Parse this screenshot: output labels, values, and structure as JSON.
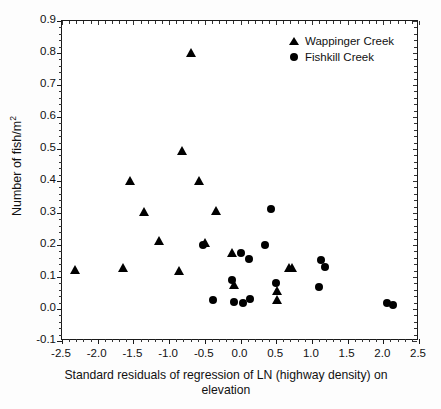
{
  "chart_data": {
    "type": "scatter",
    "title": "",
    "xlabel": "Standard residuals of regression of LN (highway density) on elevation",
    "ylabel": "Number of fish/m",
    "ylabel_sup": "2",
    "xlim": [
      -2.5,
      2.5
    ],
    "ylim": [
      -0.1,
      0.9
    ],
    "xticks": [
      "-2.5",
      "-2.0",
      "-1.5",
      "-1.0",
      "-0.5",
      "0.0",
      "0.5",
      "1.0",
      "1.5",
      "2.0",
      "2.5"
    ],
    "xtick_values": [
      -2.5,
      -2.0,
      -1.5,
      -1.0,
      -0.5,
      0.0,
      0.5,
      1.0,
      1.5,
      2.0,
      2.5
    ],
    "yticks": [
      "0.9",
      "0.8",
      "0.7",
      "0.6",
      "0.5",
      "0.4",
      "0.3",
      "0.2",
      "0.1",
      "0.0",
      "-0.1"
    ],
    "ytick_values": [
      0.9,
      0.8,
      0.7,
      0.6,
      0.5,
      0.4,
      0.3,
      0.2,
      0.1,
      0.0,
      -0.1
    ],
    "minor_ticks_per_interval": 5,
    "grid": false,
    "legend_position": "top-right",
    "series": [
      {
        "name": "Wappinger Creek",
        "marker": "triangle",
        "color": "#000000",
        "points": [
          [
            -2.31,
            0.12
          ],
          [
            -1.65,
            0.128
          ],
          [
            -1.54,
            0.4
          ],
          [
            -1.35,
            0.302
          ],
          [
            -1.14,
            0.212
          ],
          [
            -0.86,
            0.118
          ],
          [
            -0.81,
            0.492
          ],
          [
            -0.69,
            0.798
          ],
          [
            -0.58,
            0.398
          ],
          [
            -0.49,
            0.205
          ],
          [
            -0.34,
            0.305
          ],
          [
            -0.11,
            0.172
          ],
          [
            -0.09,
            0.075
          ],
          [
            0.52,
            0.055
          ],
          [
            0.52,
            0.028
          ],
          [
            0.68,
            0.128
          ],
          [
            0.72,
            0.128
          ]
        ]
      },
      {
        "name": "Fishkill Creek",
        "marker": "circle",
        "color": "#000000",
        "points": [
          [
            -0.52,
            0.2
          ],
          [
            -0.38,
            0.028
          ],
          [
            -0.12,
            0.09
          ],
          [
            -0.09,
            0.022
          ],
          [
            0.0,
            0.175
          ],
          [
            0.04,
            0.02
          ],
          [
            0.12,
            0.155
          ],
          [
            0.14,
            0.03
          ],
          [
            0.35,
            0.2
          ],
          [
            0.43,
            0.313
          ],
          [
            0.5,
            0.082
          ],
          [
            1.1,
            0.068
          ],
          [
            1.13,
            0.152
          ],
          [
            1.18,
            0.132
          ],
          [
            2.05,
            0.02
          ],
          [
            2.14,
            0.012
          ]
        ]
      }
    ]
  },
  "legend": {
    "entries": [
      {
        "label": "Wappinger Creek",
        "marker": "triangle-icon"
      },
      {
        "label": "Fishkill Creek",
        "marker": "circle-icon"
      }
    ]
  },
  "axes": {
    "x_title_line1": "Standard residuals of regression of LN (highway density) on",
    "x_title_line2": "elevation",
    "y_title_base": "Number of fish/m",
    "y_title_exponent": "2"
  }
}
